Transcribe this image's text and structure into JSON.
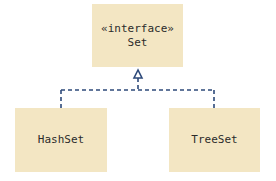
{
  "diagram": {
    "type": "uml-class-diagram",
    "colors": {
      "box_fill": "#F3E6C3",
      "connector": "#2E4A7A",
      "text": "#2b2b2b"
    },
    "nodes": [
      {
        "id": "set",
        "stereotype": "«interface»",
        "name": "Set"
      },
      {
        "id": "hashset",
        "name": "HashSet"
      },
      {
        "id": "treeset",
        "name": "TreeSet"
      }
    ],
    "edges": [
      {
        "from": "hashset",
        "to": "set",
        "kind": "realization",
        "style": "dashed",
        "arrow": "hollow-triangle"
      },
      {
        "from": "treeset",
        "to": "set",
        "kind": "realization",
        "style": "dashed",
        "arrow": "hollow-triangle"
      }
    ]
  }
}
